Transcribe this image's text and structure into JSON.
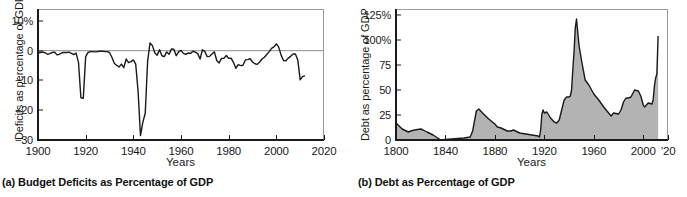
{
  "figure": {
    "panels": [
      {
        "id": "panel-a",
        "caption": "(a) Budget Deficits as Percentage of GDP",
        "chart_data": {
          "type": "line",
          "title": "(a) Budget Deficits as Percentage of GDP",
          "xlabel": "Years",
          "ylabel": "Deficits as percentage of GDP",
          "xlim": [
            1900,
            2020
          ],
          "ylim": [
            -30,
            14
          ],
          "grid": false,
          "legend": null,
          "zero_line": 0,
          "xticks": [
            1900,
            1920,
            1940,
            1960,
            1980,
            2000,
            2020
          ],
          "xtick_labels": [
            "1900",
            "1920",
            "1940",
            "1960",
            "1980",
            "2000",
            "2020"
          ],
          "yticks": [
            10,
            0,
            -10,
            -20,
            -30
          ],
          "ytick_labels": [
            "10%",
            "0",
            "−10",
            "−20",
            "−30"
          ],
          "series": [
            {
              "name": "Federal budget deficit (% of GDP)",
              "x": [
                1900,
                1901,
                1902,
                1903,
                1904,
                1905,
                1906,
                1907,
                1908,
                1909,
                1910,
                1911,
                1912,
                1913,
                1914,
                1915,
                1916,
                1917,
                1918,
                1919,
                1920,
                1921,
                1922,
                1923,
                1924,
                1925,
                1926,
                1927,
                1928,
                1929,
                1930,
                1931,
                1932,
                1933,
                1934,
                1935,
                1936,
                1937,
                1938,
                1939,
                1940,
                1941,
                1942,
                1943,
                1944,
                1945,
                1946,
                1947,
                1948,
                1949,
                1950,
                1951,
                1952,
                1953,
                1954,
                1955,
                1956,
                1957,
                1958,
                1959,
                1960,
                1961,
                1962,
                1963,
                1964,
                1965,
                1966,
                1967,
                1968,
                1969,
                1970,
                1971,
                1972,
                1973,
                1974,
                1975,
                1976,
                1977,
                1978,
                1979,
                1980,
                1981,
                1982,
                1983,
                1984,
                1985,
                1986,
                1987,
                1988,
                1989,
                1990,
                1991,
                1992,
                1993,
                1994,
                1995,
                1996,
                1997,
                1998,
                1999,
                2000,
                2001,
                2002,
                2003,
                2004,
                2005,
                2006,
                2007,
                2008,
                2009,
                2010,
                2011,
                2012
              ],
              "y": [
                -0.8,
                -0.6,
                -0.5,
                -0.7,
                -1.2,
                -1.0,
                -0.6,
                -0.5,
                -1.4,
                -1.2,
                -0.7,
                -0.6,
                -0.6,
                -0.5,
                -0.9,
                -1.3,
                -0.8,
                -4.0,
                -15.8,
                -16.0,
                -2.0,
                -0.6,
                -0.3,
                -0.3,
                -0.4,
                -0.3,
                -0.2,
                -0.2,
                -0.3,
                -0.3,
                -0.6,
                -2.2,
                -4.2,
                -4.9,
                -5.5,
                -4.5,
                -5.7,
                -2.8,
                -4.0,
                -3.7,
                -3.1,
                -4.5,
                -13.7,
                -28.5,
                -24.0,
                -21.0,
                -3.5,
                2.6,
                1.7,
                -0.7,
                -1.5,
                0.3,
                -1.7,
                -2.0,
                -0.4,
                -1.2,
                0.6,
                0.5,
                -1.7,
                -0.4,
                0.1,
                -0.9,
                -1.2,
                -0.8,
                -0.9,
                -0.2,
                -0.5,
                -1.0,
                -2.8,
                0.3,
                -0.3,
                -2.0,
                -1.9,
                -1.1,
                -0.4,
                -3.3,
                -4.1,
                -2.6,
                -2.6,
                -1.6,
                -2.6,
                -2.5,
                -3.9,
                -5.9,
                -4.7,
                -5.0,
                -4.9,
                -3.1,
                -3.0,
                -2.7,
                -3.8,
                -4.4,
                -4.6,
                -3.8,
                -2.8,
                -2.2,
                -1.3,
                -0.3,
                0.8,
                1.3,
                2.3,
                1.2,
                -1.5,
                -3.3,
                -3.4,
                -2.5,
                -1.9,
                -1.1,
                -1.1,
                -3.1,
                -9.8,
                -8.7,
                -8.4,
                -9.3
              ],
              "color": "#1a1a1a"
            }
          ]
        }
      },
      {
        "id": "panel-b",
        "caption": "(b) Debt as Percentage of GDP",
        "chart_data": {
          "type": "area",
          "title": "(b) Debt as Percentage of GDP",
          "xlabel": "Years",
          "ylabel": "Debt as percentage of GDP",
          "xlim": [
            1800,
            2020
          ],
          "ylim": [
            0,
            131
          ],
          "grid": false,
          "legend": null,
          "xticks": [
            1800,
            1840,
            1880,
            1920,
            1960,
            2000,
            2020
          ],
          "xtick_labels": [
            "1800",
            "1840",
            "1880",
            "1920",
            "1960",
            "2000",
            "’20"
          ],
          "yticks": [
            125,
            100,
            75,
            50,
            25,
            0
          ],
          "ytick_labels": [
            "125%",
            "100%",
            "75",
            "50",
            "25",
            "0"
          ],
          "fill_color": "#b3b3b3",
          "line_color": "#1a1a1a",
          "series": [
            {
              "name": "Federal debt held by public (% of GDP)",
              "x": [
                1800,
                1805,
                1810,
                1812,
                1815,
                1820,
                1822,
                1825,
                1830,
                1835,
                1836,
                1840,
                1845,
                1850,
                1855,
                1860,
                1862,
                1865,
                1867,
                1870,
                1875,
                1880,
                1882,
                1885,
                1890,
                1893,
                1895,
                1900,
                1905,
                1910,
                1915,
                1916,
                1917,
                1918,
                1919,
                1920,
                1922,
                1925,
                1928,
                1930,
                1932,
                1934,
                1936,
                1938,
                1940,
                1941,
                1942,
                1943,
                1944,
                1945,
                1946,
                1948,
                1950,
                1953,
                1956,
                1960,
                1964,
                1968,
                1972,
                1974,
                1976,
                1980,
                1982,
                1984,
                1986,
                1988,
                1990,
                1993,
                1996,
                1998,
                2000,
                2001,
                2004,
                2007,
                2008,
                2009,
                2010,
                2011,
                2012
              ],
              "y": [
                17,
                11,
                8,
                9,
                10,
                11,
                10,
                8,
                5,
                1,
                0,
                0.5,
                1,
                1.5,
                2,
                3,
                9,
                29,
                31,
                27,
                21,
                16,
                13,
                12,
                9,
                9,
                10,
                7,
                6,
                5,
                4,
                3,
                10,
                26,
                30,
                27,
                28,
                22,
                18,
                17,
                20,
                30,
                40,
                43,
                43,
                44,
                50,
                70,
                88,
                112,
                121,
                95,
                80,
                60,
                55,
                46,
                40,
                33,
                27,
                24,
                27,
                26,
                30,
                38,
                42,
                42,
                43,
                50,
                49,
                44,
                35,
                33,
                37,
                36,
                40,
                54,
                62,
                66,
                104
              ],
              "color": "#1a1a1a"
            }
          ]
        }
      }
    ]
  }
}
